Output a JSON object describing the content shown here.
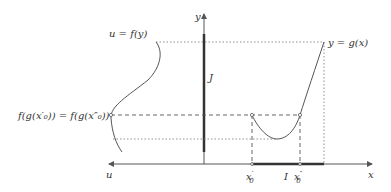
{
  "diagram": {
    "axes": {
      "x_label": "x",
      "y_label": "y",
      "u_label": "u"
    },
    "curves": {
      "g_label": "y = g(x)",
      "f_label": "u = f(y)"
    },
    "intervals": {
      "J_label": "J",
      "I_label": "I"
    },
    "points": {
      "x0_prime": "x",
      "x0_prime_sub": "0",
      "x0_prime_mark": "′",
      "x0_dprime": "x",
      "x0_dprime_sub": "0",
      "x0_dprime_mark": "″"
    },
    "equation_label": "f(g(x′₀)) = f(g(x″₀))",
    "colors": {
      "axis": "#444444",
      "curve": "#555555",
      "thick": "#333333",
      "guide": "#666666"
    }
  }
}
